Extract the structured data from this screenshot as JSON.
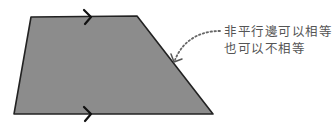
{
  "diagram": {
    "shape": "trapezoid",
    "fill_color": "#8c8c8c",
    "stroke_color": "#222222",
    "vertices": [
      [
        31,
        17
      ],
      [
        137,
        16
      ],
      [
        213,
        114
      ],
      [
        14,
        114
      ]
    ],
    "parallel_markers": [
      {
        "side": "top",
        "glyph": ">"
      },
      {
        "side": "bottom",
        "glyph": ">"
      }
    ],
    "annotation": {
      "lines": [
        "非平行邊可以相等",
        "也可以不相等"
      ],
      "text_color": "#555555",
      "points_to": "non-parallel-right-side"
    }
  }
}
